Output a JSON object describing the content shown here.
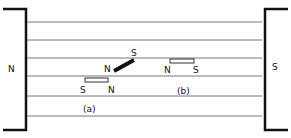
{
  "diagram": {
    "left_pole": "N",
    "right_pole": "S",
    "field_line_ys": [
      22,
      40,
      58,
      76,
      96,
      116
    ],
    "magnet_a": {
      "label": "(a)",
      "pivot_needle": {
        "n": "N",
        "s": "S"
      },
      "bar": {
        "s": "S",
        "n": "N"
      }
    },
    "magnet_b": {
      "label": "(b)",
      "bar": {
        "n": "N",
        "s": "S"
      }
    }
  }
}
